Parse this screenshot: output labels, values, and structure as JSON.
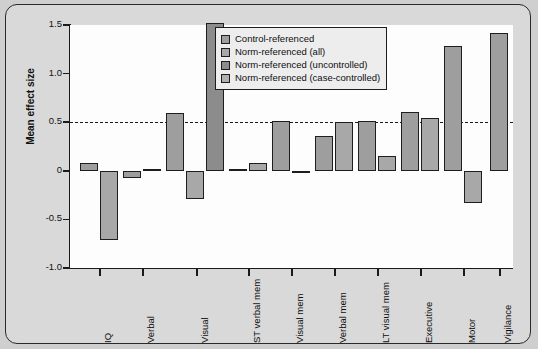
{
  "chart_data": {
    "type": "bar",
    "title": "",
    "xlabel": "",
    "ylabel": "Mean effect size",
    "ylim": [
      -1.0,
      1.5
    ],
    "yticks": [
      "1.5",
      "1.0",
      "0.5",
      "0",
      "-0.5",
      "-1.0"
    ],
    "ytick_values": [
      1.5,
      1.0,
      0.5,
      0.0,
      -0.5,
      -1.0
    ],
    "grid": false,
    "reference_line": 0.5,
    "legend_position": "top-right",
    "legend": [
      "Control-referenced",
      "Norm-referenced (all)",
      "Norm-referenced (uncontrolled)",
      "Norm-referenced (case-controlled)"
    ],
    "categories": [
      "IQ",
      "Verbal",
      "Visual",
      "ST verbal mem",
      "Visual mem",
      "Verbal mem",
      "LT visual mem",
      "Executive",
      "Motor",
      "Vigilance"
    ],
    "series": [
      {
        "name": "Control-referenced",
        "color": "#9e9e9e",
        "values": [
          0.08,
          -0.07,
          0.59,
          0.02,
          0.51,
          0.36,
          0.51,
          0.61,
          1.28,
          1.42
        ]
      },
      {
        "name": "Norm-referenced (all)",
        "color": "#a8a8a8",
        "values": [
          -0.71,
          0.02,
          -0.29,
          0.08,
          0.0,
          0.5,
          0.15,
          0.54,
          -0.33,
          null
        ]
      },
      {
        "name": "Norm-referenced (uncontrolled)",
        "color": "#8c8c8c",
        "values": [
          null,
          -0.63,
          1.52,
          null,
          null,
          null,
          null,
          null,
          null,
          null
        ]
      },
      {
        "name": "Norm-referenced (case-controlled)",
        "color": "#b0b0b0",
        "values": [
          null,
          null,
          null,
          null,
          null,
          null,
          null,
          null,
          null,
          null
        ]
      }
    ],
    "bars": [
      {
        "category": "IQ",
        "series": "Control-referenced",
        "value": 0.08,
        "x": 74,
        "w": 18
      },
      {
        "category": "IQ",
        "series": "Norm-referenced (all)",
        "value": -0.71,
        "x": 94,
        "w": 18
      },
      {
        "category": "Verbal",
        "series": "Control-referenced",
        "value": -0.07,
        "x": 117,
        "w": 18
      },
      {
        "category": "Verbal",
        "series": "Norm-referenced (all)",
        "value": 0.02,
        "x": 137,
        "w": 18
      },
      {
        "category": "Visual",
        "series": "Control-referenced",
        "value": 0.59,
        "x": 160,
        "w": 18
      },
      {
        "category": "Visual",
        "series": "Norm-referenced (all)",
        "value": -0.29,
        "x": 180,
        "w": 18
      },
      {
        "category": "Visual",
        "series": "Norm-referenced (uncontrolled)",
        "value": 1.52,
        "x": 200,
        "w": 18
      },
      {
        "category": "ST verbal mem",
        "series": "Control-referenced",
        "value": 0.02,
        "x": 223,
        "w": 18
      },
      {
        "category": "ST verbal mem",
        "series": "Norm-referenced (all)",
        "value": 0.08,
        "x": 243,
        "w": 18
      },
      {
        "category": "Visual mem",
        "series": "Control-referenced",
        "value": 0.51,
        "x": 266,
        "w": 18
      },
      {
        "category": "Visual mem",
        "series": "Norm-referenced (all)",
        "value": 0.0,
        "x": 286,
        "w": 18
      },
      {
        "category": "Verbal mem",
        "series": "Control-referenced",
        "value": 0.36,
        "x": 309,
        "w": 18
      },
      {
        "category": "Verbal mem",
        "series": "Norm-referenced (all)",
        "value": 0.5,
        "x": 329,
        "w": 18
      },
      {
        "category": "LT visual mem",
        "series": "Control-referenced",
        "value": 0.51,
        "x": 352,
        "w": 18
      },
      {
        "category": "LT visual mem",
        "series": "Norm-referenced (all)",
        "value": 0.15,
        "x": 372,
        "w": 18
      },
      {
        "category": "Executive",
        "series": "Control-referenced",
        "value": 0.61,
        "x": 395,
        "w": 18
      },
      {
        "category": "Executive",
        "series": "Norm-referenced (all)",
        "value": 0.54,
        "x": 415,
        "w": 18
      },
      {
        "category": "Motor",
        "series": "Control-referenced",
        "value": 1.28,
        "x": 438,
        "w": 18
      },
      {
        "category": "Motor",
        "series": "Norm-referenced (all)",
        "value": -0.33,
        "x": 458,
        "w": 18
      },
      {
        "category": "Vigilance",
        "series": "Control-referenced",
        "value": 1.42,
        "x": 484,
        "w": 18
      }
    ],
    "xtick_positions": [
      93,
      136,
      190,
      242,
      285,
      328,
      371,
      414,
      457,
      493
    ]
  }
}
